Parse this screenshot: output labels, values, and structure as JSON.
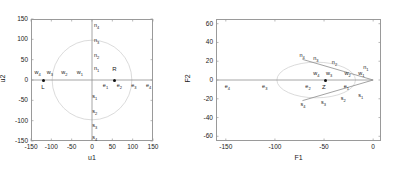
{
  "figure": {
    "background": "#ffffff",
    "axis_color": "#9a9a9a",
    "text_color": "#1a1a1a",
    "marker_color": "#111111",
    "ellipse_color": "#d2d2d2",
    "ray_color": "#8c8c8c"
  },
  "chart_data": [
    {
      "type": "scatter",
      "id": "left-panel",
      "title": "",
      "xlabel": "u1",
      "ylabel": "u2",
      "xlim": [
        -150,
        150
      ],
      "ylim": [
        -150,
        150
      ],
      "xticks": [
        -150,
        -100,
        -50,
        0,
        50,
        100,
        150
      ],
      "xticklabels": [
        "-150",
        "-100",
        "-50",
        "0",
        "50",
        "100",
        "150"
      ],
      "yticks": [
        -150,
        -100,
        -50,
        0,
        50,
        100,
        150
      ],
      "yticklabels": [
        "-150",
        "-100",
        "-50",
        "0",
        "50",
        "100",
        "150"
      ],
      "grid": false,
      "legend": null,
      "annotations": [
        {
          "text": "L",
          "base": "L",
          "sub": "",
          "x": -120,
          "y": -20
        },
        {
          "text": "R",
          "base": "R",
          "sub": "",
          "x": 55,
          "y": 24
        }
      ],
      "markers": [
        {
          "name": "L",
          "x": -120,
          "y": 0
        },
        {
          "name": "R",
          "x": 55,
          "y": 0
        }
      ],
      "ellipse": {
        "cx": 0,
        "cy": 0,
        "rx": 98,
        "ry": 98
      },
      "axis_lines": [
        {
          "from": [
            -150,
            0
          ],
          "to": [
            150,
            0
          ]
        },
        {
          "from": [
            0,
            -150
          ],
          "to": [
            0,
            150
          ]
        }
      ],
      "point_labels": [
        {
          "base": "w",
          "sub": "4",
          "x": -134,
          "y": 16
        },
        {
          "base": "w",
          "sub": "3",
          "x": -104,
          "y": 16
        },
        {
          "base": "w",
          "sub": "2",
          "x": -68,
          "y": 16
        },
        {
          "base": "w",
          "sub": "1",
          "x": -30,
          "y": 16
        },
        {
          "base": "n",
          "sub": "4",
          "x": 12,
          "y": 132
        },
        {
          "base": "n",
          "sub": "3",
          "x": 12,
          "y": 96
        },
        {
          "base": "n",
          "sub": "2",
          "x": 12,
          "y": 60
        },
        {
          "base": "n",
          "sub": "1",
          "x": 12,
          "y": 26
        },
        {
          "base": "s",
          "sub": "1",
          "x": 8,
          "y": -42
        },
        {
          "base": "s",
          "sub": "2",
          "x": 8,
          "y": -78
        },
        {
          "base": "s",
          "sub": "3",
          "x": 8,
          "y": -112
        },
        {
          "base": "s",
          "sub": "4",
          "x": 8,
          "y": -143
        },
        {
          "base": "e",
          "sub": "1",
          "x": 34,
          "y": -14
        },
        {
          "base": "e",
          "sub": "2",
          "x": 68,
          "y": -14
        },
        {
          "base": "e",
          "sub": "3",
          "x": 104,
          "y": -14
        },
        {
          "base": "e",
          "sub": "4",
          "x": 140,
          "y": -14
        }
      ]
    },
    {
      "type": "scatter",
      "id": "right-panel",
      "title": "",
      "xlabel": "F1",
      "ylabel": "F2",
      "xlim": [
        -160,
        8
      ],
      "ylim": [
        -65,
        65
      ],
      "xticks": [
        -150,
        -100,
        -50,
        0
      ],
      "xticklabels": [
        "-150",
        "-100",
        "-50",
        "0"
      ],
      "yticks": [
        -60,
        -40,
        -20,
        0,
        20,
        40,
        60
      ],
      "yticklabels": [
        "-60",
        "-40",
        "-20",
        "0",
        "20",
        "40",
        "60"
      ],
      "grid": false,
      "legend": null,
      "annotations": [
        {
          "text": "Z",
          "base": "Z",
          "sub": "",
          "x": -50,
          "y": -9
        }
      ],
      "markers": [
        {
          "name": "Z",
          "x": -49,
          "y": 0
        }
      ],
      "ellipse": {
        "cx": -58,
        "cy": 0,
        "rx": 40,
        "ry": 19
      },
      "axis_lines": [
        {
          "from": [
            -160,
            0
          ],
          "to": [
            0,
            0
          ]
        }
      ],
      "rays": [
        {
          "from": [
            0,
            0
          ],
          "to": [
            -72,
            22
          ]
        },
        {
          "from": [
            0,
            0
          ],
          "to": [
            -72,
            -22
          ]
        }
      ],
      "point_labels": [
        {
          "base": "n",
          "sub": "4",
          "x": -72,
          "y": 26
        },
        {
          "base": "n",
          "sub": "3",
          "x": -58,
          "y": 22
        },
        {
          "base": "n",
          "sub": "2",
          "x": -39,
          "y": 18
        },
        {
          "base": "n",
          "sub": "1",
          "x": -7,
          "y": 13
        },
        {
          "base": "w",
          "sub": "4",
          "x": -58,
          "y": 6
        },
        {
          "base": "w",
          "sub": "3",
          "x": -45,
          "y": 6
        },
        {
          "base": "w",
          "sub": "2",
          "x": -26,
          "y": 6
        },
        {
          "base": "w",
          "sub": "1",
          "x": -12,
          "y": 6
        },
        {
          "base": "e",
          "sub": "1",
          "x": -27,
          "y": -7
        },
        {
          "base": "e",
          "sub": "2",
          "x": -66,
          "y": -7
        },
        {
          "base": "e",
          "sub": "3",
          "x": -110,
          "y": -7
        },
        {
          "base": "e",
          "sub": "4",
          "x": -148,
          "y": -7
        },
        {
          "base": "s",
          "sub": "1",
          "x": -12,
          "y": -17
        },
        {
          "base": "s",
          "sub": "2",
          "x": -30,
          "y": -20
        },
        {
          "base": "s",
          "sub": "3",
          "x": -50,
          "y": -24
        },
        {
          "base": "s",
          "sub": "4",
          "x": -71,
          "y": -27
        }
      ]
    }
  ]
}
